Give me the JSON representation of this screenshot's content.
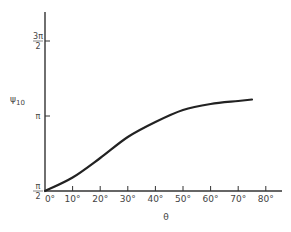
{
  "chart_data": {
    "type": "line",
    "title": "",
    "xlabel": "θ",
    "ylabel": "ψ10",
    "ylabel_main": "ψ",
    "ylabel_sub": "10",
    "x_ticks": [
      "0°",
      "10°",
      "20°",
      "30°",
      "40°",
      "50°",
      "60°",
      "70°",
      "80°"
    ],
    "y_ticks": [
      {
        "num": "π",
        "den": "2",
        "value_pi": 0.5
      },
      {
        "num": "π",
        "den": "",
        "value_pi": 1.0
      },
      {
        "num": "3π",
        "den": "2",
        "value_pi": 1.5
      }
    ],
    "xlim": [
      0,
      80
    ],
    "ylim_pi_units": [
      0.5,
      1.5
    ],
    "grid": false,
    "series": [
      {
        "name": "ψ10",
        "x": [
          0,
          10,
          20,
          30,
          40,
          50,
          60,
          70,
          75
        ],
        "y_pi_units": [
          0.5,
          0.59,
          0.72,
          0.86,
          0.96,
          1.04,
          1.08,
          1.1,
          1.11
        ]
      }
    ]
  }
}
